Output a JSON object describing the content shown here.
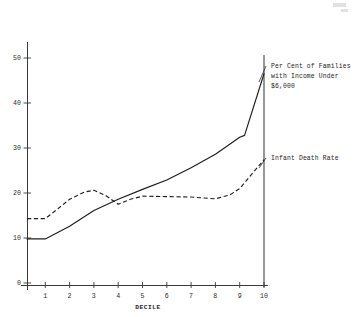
{
  "chart_data": {
    "type": "line",
    "title": "",
    "xlabel": "DECILE",
    "ylabel": "",
    "xlim": [
      0,
      10.35
    ],
    "ylim": [
      0,
      57
    ],
    "grid": false,
    "legend_position": "right-inline-annotations",
    "x_ticks": [
      "1",
      "2",
      "3",
      "4",
      "5",
      "6",
      "7",
      "8",
      "9",
      "10"
    ],
    "x_tick_values": [
      1,
      2,
      3,
      4,
      5,
      6,
      7,
      8,
      9,
      10
    ],
    "y_ticks": [
      "0",
      "10",
      "20",
      "30",
      "40",
      "50"
    ],
    "y_tick_values": [
      0,
      10,
      20,
      30,
      40,
      50
    ],
    "categories": [
      1,
      2,
      3,
      4,
      5,
      6,
      7,
      8,
      9,
      10
    ],
    "series": [
      {
        "name": "Per Cent of Families with Income Under $6,000",
        "style": "solid",
        "color": "#1d1d1d",
        "x": [
          0.25,
          1,
          2,
          3,
          4,
          5,
          6,
          7,
          8,
          9,
          9.2,
          10
        ],
        "values": [
          9.8,
          9.8,
          12.6,
          16.1,
          18.6,
          20.8,
          22.9,
          25.6,
          28.6,
          32.4,
          32.8,
          46.5
        ]
      },
      {
        "name": "Infant Death Rate",
        "style": "dashed",
        "color": "#1d1d1d",
        "x": [
          0.25,
          1,
          1.4,
          2,
          2.6,
          3,
          3.5,
          4,
          4.5,
          5,
          6,
          7,
          8,
          8.6,
          9,
          10
        ],
        "values": [
          14.3,
          14.3,
          16.0,
          18.6,
          20.2,
          20.6,
          19.4,
          17.5,
          18.6,
          19.3,
          19.2,
          19.1,
          18.7,
          19.6,
          21.0,
          27.4
        ]
      }
    ],
    "annotations": [
      {
        "id": "series-1-label",
        "lines": [
          "Per Cent of Families",
          "with Income Under",
          "$6,000"
        ],
        "anchor_x": 10.0,
        "anchor_y": 44.0
      },
      {
        "id": "series-2-label",
        "lines": [
          "Infant Death Rate"
        ],
        "anchor_x": 10.0,
        "anchor_y": 26.5
      }
    ]
  },
  "axes": {
    "x_axis_title": "DECILE",
    "y_tick_labels": [
      "50",
      "40",
      "30",
      "20",
      "10",
      "0"
    ],
    "x_tick_labels": [
      "1",
      "2",
      "3",
      "4",
      "5",
      "6",
      "7",
      "8",
      "9",
      "10"
    ]
  },
  "annotations": {
    "families_line_1": "Per Cent of Families",
    "families_line_2": "with Income Under",
    "families_line_3": "$6,000",
    "infant_line_1": "Infant Death Rate"
  }
}
